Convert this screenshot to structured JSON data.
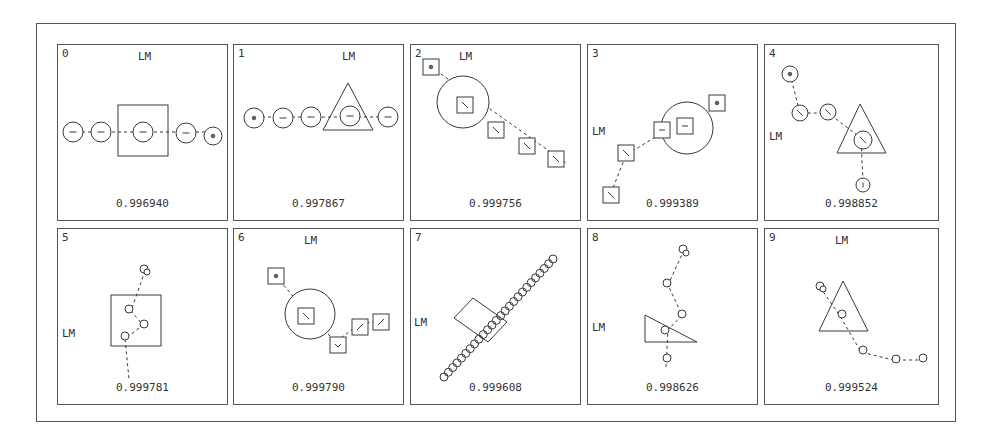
{
  "figure": {
    "stroke_color": "#3a3a3a",
    "label_lm": "LM",
    "panels": [
      {
        "index": "0",
        "score": "0.996940",
        "lm_pos": [
          80,
          5
        ],
        "shapes": [
          {
            "t": "rect",
            "x": 60,
            "y": 60,
            "w": 50,
            "h": 51
          },
          {
            "t": "path",
            "d": "M 24 87 L 155 87"
          },
          {
            "t": "circle",
            "cx": 15,
            "cy": 87,
            "r": 10,
            "mark": "dash"
          },
          {
            "t": "circle",
            "cx": 43,
            "cy": 87,
            "r": 10,
            "mark": "dash"
          },
          {
            "t": "circle",
            "cx": 85,
            "cy": 87,
            "r": 10,
            "mark": "dash"
          },
          {
            "t": "circle",
            "cx": 128,
            "cy": 88,
            "r": 10,
            "mark": "dash"
          },
          {
            "t": "circle",
            "cx": 155,
            "cy": 91,
            "r": 9,
            "mark": "dot"
          }
        ]
      },
      {
        "index": "1",
        "score": "0.997867",
        "lm_pos": [
          108,
          5
        ],
        "shapes": [
          {
            "t": "poly",
            "pts": "114,38 89,85 139,85"
          },
          {
            "t": "path",
            "d": "M 22 72 L 150 72"
          },
          {
            "t": "circle",
            "cx": 20,
            "cy": 73,
            "r": 10,
            "mark": "dot"
          },
          {
            "t": "circle",
            "cx": 49,
            "cy": 73,
            "r": 10,
            "mark": "dash"
          },
          {
            "t": "circle",
            "cx": 77,
            "cy": 72,
            "r": 10,
            "mark": "dash"
          },
          {
            "t": "circle",
            "cx": 116,
            "cy": 71,
            "r": 10,
            "mark": "dash"
          },
          {
            "t": "circle",
            "cx": 154,
            "cy": 72,
            "r": 10,
            "mark": "dash"
          }
        ]
      },
      {
        "index": "2",
        "score": "0.999756",
        "lm_pos": [
          48,
          5
        ],
        "shapes": [
          {
            "t": "circle",
            "cx": 52,
            "cy": 57,
            "r": 26
          },
          {
            "t": "path",
            "d": "M 20 22 L 155 118"
          },
          {
            "t": "sq",
            "cx": 20,
            "cy": 22,
            "s": 16,
            "mark": "dot"
          },
          {
            "t": "sq",
            "cx": 54,
            "cy": 60,
            "s": 16,
            "mark": "diag"
          },
          {
            "t": "sq",
            "cx": 85,
            "cy": 85,
            "s": 16,
            "mark": "diag"
          },
          {
            "t": "sq",
            "cx": 116,
            "cy": 101,
            "s": 16,
            "mark": "diag"
          },
          {
            "t": "sq",
            "cx": 145,
            "cy": 114,
            "s": 16,
            "mark": "diag"
          }
        ]
      },
      {
        "index": "3",
        "score": "0.999389",
        "lm_pos": [
          4,
          80
        ],
        "shapes": [
          {
            "t": "circle",
            "cx": 99,
            "cy": 83,
            "r": 26
          },
          {
            "t": "path",
            "d": "M 23 148 L 38 110 L 74 88 L 98 83 L 128 58"
          },
          {
            "t": "sq",
            "cx": 129,
            "cy": 58,
            "s": 16,
            "mark": "dot"
          },
          {
            "t": "sq",
            "cx": 97,
            "cy": 81,
            "s": 16,
            "mark": "dash"
          },
          {
            "t": "sq",
            "cx": 74,
            "cy": 85,
            "s": 16,
            "mark": "dash"
          },
          {
            "t": "sq",
            "cx": 38,
            "cy": 108,
            "s": 16,
            "mark": "diag"
          },
          {
            "t": "sq",
            "cx": 23,
            "cy": 150,
            "s": 16,
            "mark": "diag"
          }
        ]
      },
      {
        "index": "4",
        "score": "0.998852",
        "lm_pos": [
          4,
          85
        ],
        "shapes": [
          {
            "t": "poly",
            "pts": "95,59 72,108 121,108"
          },
          {
            "t": "path",
            "d": "M 25 29 L 35 68 L 63 68 L 96 93 L 98 136"
          },
          {
            "t": "circle",
            "cx": 25,
            "cy": 29,
            "r": 8,
            "mark": "dot"
          },
          {
            "t": "circle",
            "cx": 35,
            "cy": 68,
            "r": 8,
            "mark": "diag"
          },
          {
            "t": "circle",
            "cx": 63,
            "cy": 67,
            "r": 8,
            "mark": "diag"
          },
          {
            "t": "circle",
            "cx": 98,
            "cy": 95,
            "r": 9,
            "mark": "diag"
          },
          {
            "t": "circle",
            "cx": 98,
            "cy": 140,
            "r": 7,
            "mark": "vert"
          }
        ]
      },
      {
        "index": "5",
        "score": "0.999781",
        "lm_pos": [
          4,
          98
        ],
        "shapes": [
          {
            "t": "rect",
            "x": 53,
            "y": 66,
            "w": 50,
            "h": 51
          },
          {
            "t": "path",
            "d": "M 87 42 L 73 82 L 85 96 L 67 110 L 71 150"
          },
          {
            "t": "circle",
            "cx": 86,
            "cy": 40,
            "r": 4,
            "mark": "none"
          },
          {
            "t": "circle",
            "cx": 89,
            "cy": 43,
            "r": 3,
            "mark": "none"
          },
          {
            "t": "circle",
            "cx": 71,
            "cy": 80,
            "r": 4,
            "mark": "none"
          },
          {
            "t": "circle",
            "cx": 86,
            "cy": 95,
            "r": 4,
            "mark": "none"
          },
          {
            "t": "circle",
            "cx": 67,
            "cy": 107,
            "r": 4,
            "mark": "none"
          }
        ]
      },
      {
        "index": "6",
        "score": "0.999790",
        "lm_pos": [
          70,
          5
        ],
        "shapes": [
          {
            "t": "circle",
            "cx": 76,
            "cy": 85,
            "r": 25
          },
          {
            "t": "path",
            "d": "M 42 47 L 72 83 L 102 113 L 125 95 L 147 92"
          },
          {
            "t": "sq",
            "cx": 42,
            "cy": 47,
            "s": 16,
            "mark": "dot"
          },
          {
            "t": "sq",
            "cx": 72,
            "cy": 87,
            "s": 16,
            "mark": "diag"
          },
          {
            "t": "sq",
            "cx": 104,
            "cy": 116,
            "s": 16,
            "mark": "v"
          },
          {
            "t": "sq",
            "cx": 126,
            "cy": 98,
            "s": 16,
            "mark": "diag2"
          },
          {
            "t": "sq",
            "cx": 147,
            "cy": 93,
            "s": 16,
            "mark": "diag2"
          }
        ]
      },
      {
        "index": "7",
        "score": "0.999608",
        "lm_pos": [
          3,
          87
        ],
        "shapes": [
          {
            "t": "poly",
            "pts": "62,69 96,93 77,113 43,89"
          },
          {
            "t": "chain",
            "x1": 33,
            "y1": 148,
            "x2": 142,
            "y2": 30,
            "n": 26,
            "r": 4
          }
        ]
      },
      {
        "index": "8",
        "score": "0.998626",
        "lm_pos": [
          4,
          92
        ],
        "shapes": [
          {
            "t": "poly",
            "pts": "57,86 109,113 57,113"
          },
          {
            "t": "path",
            "d": "M 96 21 L 80 56 L 94 86 L 80 101 L 78 138"
          },
          {
            "t": "circle",
            "cx": 95,
            "cy": 20,
            "r": 4,
            "mark": "none"
          },
          {
            "t": "circle",
            "cx": 98,
            "cy": 24,
            "r": 3,
            "mark": "none"
          },
          {
            "t": "circle",
            "cx": 79,
            "cy": 54,
            "r": 4,
            "mark": "none"
          },
          {
            "t": "circle",
            "cx": 94,
            "cy": 85,
            "r": 4,
            "mark": "none"
          },
          {
            "t": "circle",
            "cx": 77,
            "cy": 101,
            "r": 4,
            "mark": "none"
          },
          {
            "t": "circle",
            "cx": 79,
            "cy": 129,
            "r": 4,
            "mark": "none"
          }
        ]
      },
      {
        "index": "9",
        "score": "0.999524",
        "lm_pos": [
          70,
          5
        ],
        "shapes": [
          {
            "t": "poly",
            "pts": "78,52 54,102 103,102"
          },
          {
            "t": "path",
            "d": "M 55 58 L 75 87 L 96 123 L 128 131 L 158 131"
          },
          {
            "t": "circle",
            "cx": 55,
            "cy": 57,
            "r": 4,
            "mark": "none"
          },
          {
            "t": "circle",
            "cx": 58,
            "cy": 60,
            "r": 3,
            "mark": "none"
          },
          {
            "t": "circle",
            "cx": 77,
            "cy": 85,
            "r": 4,
            "mark": "none"
          },
          {
            "t": "circle",
            "cx": 98,
            "cy": 121,
            "r": 4,
            "mark": "none"
          },
          {
            "t": "circle",
            "cx": 131,
            "cy": 130,
            "r": 4,
            "mark": "none"
          },
          {
            "t": "circle",
            "cx": 158,
            "cy": 129,
            "r": 4,
            "mark": "none"
          }
        ]
      }
    ]
  }
}
